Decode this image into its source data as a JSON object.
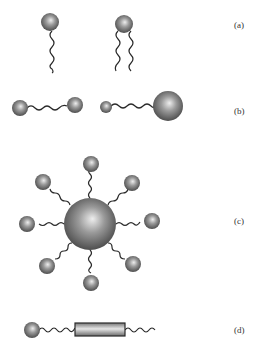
{
  "figure": {
    "panels": [
      {
        "id": "a",
        "label": "(a)",
        "description": "single-tail and double-tail amphiphiles"
      },
      {
        "id": "b",
        "label": "(b)",
        "description": "bolaamphiphiles: symmetric and asymmetric heads"
      },
      {
        "id": "c",
        "label": "(c)",
        "description": "star-shaped amphiphile with central sphere and eight arms"
      },
      {
        "id": "d",
        "label": "(d)",
        "description": "rod-coil amphiphile with head, rod and tail"
      }
    ]
  },
  "colors": {
    "sphere_light": "#e0e0e0",
    "sphere_dark": "#5a5a5a",
    "tail": "#2a2a2a",
    "label": "#333333"
  }
}
